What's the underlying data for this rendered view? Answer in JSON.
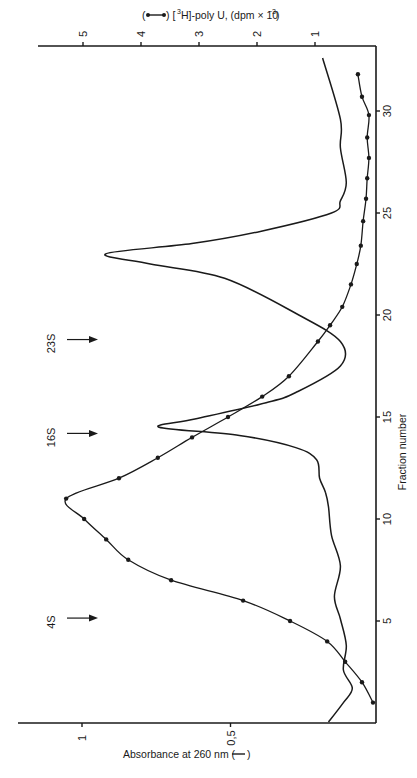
{
  "chart_data": {
    "type": "line",
    "orientation": "rotated-90-clockwise",
    "title": "",
    "xlabel": "Fraction number",
    "ylabel_left": "Absorbance at 260 nm (——)",
    "ylabel_right": "(●—●) [3H]-poly U, (dpm × 10^-3)",
    "x_ticks": [
      5,
      10,
      15,
      20,
      25,
      30
    ],
    "x_range": [
      0,
      33
    ],
    "y_left_ticks": [
      "0,5",
      "1"
    ],
    "y_left_range": [
      0,
      1.1
    ],
    "y_right_ticks": [
      1,
      2,
      3,
      4,
      5
    ],
    "y_right_range": [
      0,
      5.8
    ],
    "sedimentation_markers": [
      {
        "label": "4S",
        "fraction": 4.8
      },
      {
        "label": "16S",
        "fraction": 14.0
      },
      {
        "label": "23S",
        "fraction": 18.6
      }
    ],
    "series": [
      {
        "name": "[3H]-poly U (dpm × 10^-3)",
        "style": "line-with-dots",
        "axis": "right",
        "x": [
          1,
          2,
          3,
          4,
          5,
          6,
          7,
          8,
          9,
          10,
          11,
          12,
          13,
          14,
          15,
          16,
          17,
          18.7,
          19.5,
          20.4,
          21.5,
          22.5,
          23.4,
          24.6,
          25.7,
          26.7,
          27.7,
          28.7,
          29.8,
          30.7,
          31.8
        ],
        "values": [
          0.0,
          0.19,
          0.48,
          0.79,
          1.43,
          2.24,
          3.48,
          4.22,
          4.6,
          4.98,
          5.29,
          4.38,
          3.71,
          3.12,
          2.5,
          1.91,
          1.45,
          0.95,
          0.74,
          0.53,
          0.38,
          0.28,
          0.21,
          0.17,
          0.12,
          0.1,
          0.07,
          0.1,
          0.07,
          0.19,
          0.26
        ]
      },
      {
        "name": "Absorbance at 260 nm",
        "style": "solid-line",
        "axis": "left",
        "x": [
          0.05,
          1.0,
          1.7,
          2.6,
          3.8,
          5.1,
          6.2,
          7.7,
          9.2,
          10.6,
          11.3,
          12.0,
          12.9,
          13.5,
          14.1,
          14.5,
          14.9,
          15.7,
          16.2,
          17.5,
          18.7,
          20.0,
          21.8,
          22.5,
          23.0,
          23.5,
          24.1,
          25.0,
          25.6,
          26.5,
          28.2,
          29.6,
          32.6
        ],
        "values": [
          0.17,
          0.12,
          0.09,
          0.12,
          0.11,
          0.13,
          0.15,
          0.13,
          0.16,
          0.17,
          0.18,
          0.2,
          0.21,
          0.28,
          0.47,
          0.74,
          0.62,
          0.38,
          0.28,
          0.13,
          0.13,
          0.27,
          0.52,
          0.77,
          0.92,
          0.63,
          0.4,
          0.16,
          0.13,
          0.11,
          0.13,
          0.13,
          0.19
        ]
      }
    ]
  },
  "labels": {
    "right_axis_title": "[3H]-poly U, (dpm × 10",
    "right_axis_exp": "−3",
    "bottom_axis_title": "Absorbance at 260 nm (",
    "x_axis_title": "Fraction number"
  }
}
